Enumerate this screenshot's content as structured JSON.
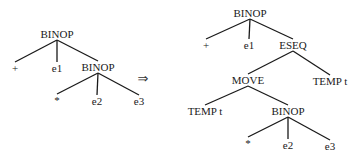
{
  "diagram": {
    "type": "tree-rewrite",
    "colors": {
      "ink": "#1a1a1a",
      "background": "#ffffff"
    },
    "arrow": {
      "symbol": "⇒",
      "x": 143,
      "y": 78
    },
    "left_tree": {
      "nodes": [
        {
          "id": "L0",
          "label": "BINOP",
          "x": 57,
          "y": 34
        },
        {
          "id": "L1",
          "label": "+",
          "x": 15,
          "y": 68
        },
        {
          "id": "L2",
          "label": "e1",
          "x": 57,
          "y": 68
        },
        {
          "id": "L3",
          "label": "BINOP",
          "x": 98,
          "y": 67
        },
        {
          "id": "L4",
          "label": "*",
          "x": 57,
          "y": 100
        },
        {
          "id": "L5",
          "label": "e2",
          "x": 97,
          "y": 101
        },
        {
          "id": "L6",
          "label": "e3",
          "x": 139,
          "y": 101
        }
      ],
      "edges": [
        [
          "L0",
          "L1"
        ],
        [
          "L0",
          "L2"
        ],
        [
          "L0",
          "L3"
        ],
        [
          "L3",
          "L4"
        ],
        [
          "L3",
          "L5"
        ],
        [
          "L3",
          "L6"
        ]
      ]
    },
    "right_tree": {
      "nodes": [
        {
          "id": "R0",
          "label": "BINOP",
          "x": 250,
          "y": 13
        },
        {
          "id": "R1",
          "label": "+",
          "x": 206,
          "y": 45
        },
        {
          "id": "R2",
          "label": "e1",
          "x": 249,
          "y": 45
        },
        {
          "id": "R3",
          "label": "ESEQ",
          "x": 293,
          "y": 45
        },
        {
          "id": "R4",
          "label": "MOVE",
          "x": 248,
          "y": 80
        },
        {
          "id": "R5",
          "label": "TEMP t",
          "x": 330,
          "y": 81
        },
        {
          "id": "R6",
          "label": "TEMP t",
          "x": 205,
          "y": 111
        },
        {
          "id": "R7",
          "label": "BINOP",
          "x": 288,
          "y": 111
        },
        {
          "id": "R8",
          "label": "*",
          "x": 248,
          "y": 143
        },
        {
          "id": "R9",
          "label": "e2",
          "x": 288,
          "y": 145
        },
        {
          "id": "R10",
          "label": "e3",
          "x": 330,
          "y": 146
        }
      ],
      "edges": [
        [
          "R0",
          "R1"
        ],
        [
          "R0",
          "R2"
        ],
        [
          "R0",
          "R3"
        ],
        [
          "R3",
          "R4"
        ],
        [
          "R3",
          "R5"
        ],
        [
          "R4",
          "R6"
        ],
        [
          "R4",
          "R7"
        ],
        [
          "R7",
          "R8"
        ],
        [
          "R7",
          "R9"
        ],
        [
          "R7",
          "R10"
        ]
      ]
    }
  }
}
